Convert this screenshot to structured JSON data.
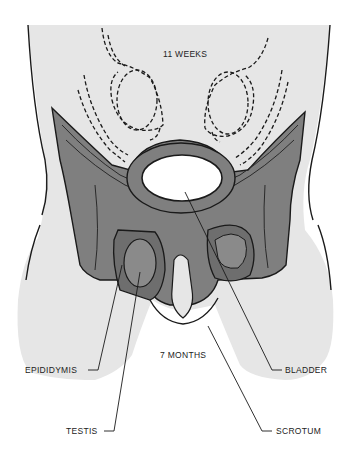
{
  "diagram": {
    "type": "anatomical illustration",
    "stage_labels": {
      "early": "11 WEEKS",
      "late": "7 MONTHS"
    },
    "callouts": [
      {
        "id": "epididymis",
        "label": "EPIDIDYMIS",
        "side": "left"
      },
      {
        "id": "testis",
        "label": "TESTIS",
        "side": "left"
      },
      {
        "id": "bladder",
        "label": "BLADDER",
        "side": "right"
      },
      {
        "id": "scrotum",
        "label": "SCROTUM",
        "side": "right"
      }
    ],
    "colors": {
      "skin": "#e6e6e6",
      "tissue": "#7f7f7f",
      "tissue_dark": "#6e6e6e",
      "outline": "#1a1a1a",
      "background": "#ffffff"
    }
  }
}
